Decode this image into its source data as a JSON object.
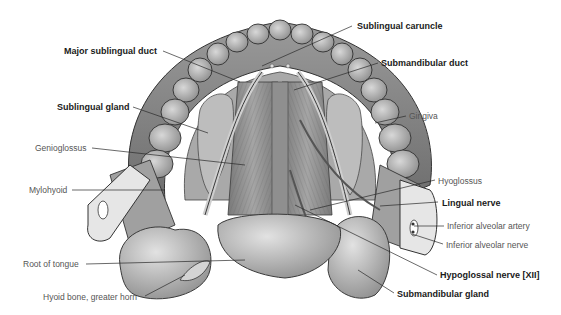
{
  "figure": {
    "labels": [
      {
        "id": "major-sublingual-duct",
        "text": "Major sublingual duct",
        "bold": true,
        "x": 64,
        "y": 46
      },
      {
        "id": "sublingual-caruncle",
        "text": "Sublingual caruncle",
        "bold": true,
        "x": 357,
        "y": 21
      },
      {
        "id": "submandibular-duct",
        "text": "Submandibular duct",
        "bold": true,
        "x": 381,
        "y": 58
      },
      {
        "id": "sublingual-gland",
        "text": "Sublingual gland",
        "bold": true,
        "x": 57,
        "y": 102
      },
      {
        "id": "gingiva",
        "text": "Gingiva",
        "bold": false,
        "x": 409,
        "y": 111
      },
      {
        "id": "genioglossus",
        "text": "Genioglossus",
        "bold": false,
        "x": 35,
        "y": 143
      },
      {
        "id": "mylohyoid",
        "text": "Mylohyoid",
        "bold": false,
        "x": 29,
        "y": 185
      },
      {
        "id": "hyoglossus",
        "text": "Hyoglossus",
        "bold": false,
        "x": 438,
        "y": 176
      },
      {
        "id": "lingual-nerve",
        "text": "Lingual nerve",
        "bold": true,
        "x": 442,
        "y": 198
      },
      {
        "id": "inferior-alveolar-artery",
        "text": "Inferior alveolar artery",
        "bold": false,
        "x": 447,
        "y": 221
      },
      {
        "id": "inferior-alveolar-nerve",
        "text": "Inferior alveolar nerve",
        "bold": false,
        "x": 446,
        "y": 240
      },
      {
        "id": "root-of-tongue",
        "text": "Root of tongue",
        "bold": false,
        "x": 23,
        "y": 259
      },
      {
        "id": "hypoglossal-nerve",
        "text": "Hypoglossal nerve [XII]",
        "bold": true,
        "x": 440,
        "y": 270
      },
      {
        "id": "hyoid-bone-greater-horn",
        "text": "Hyoid bone, greater horn",
        "bold": false,
        "x": 43,
        "y": 292
      },
      {
        "id": "submandibular-gland",
        "text": "Submandibular gland",
        "bold": true,
        "x": 397,
        "y": 289
      }
    ],
    "leaders": [
      {
        "id": "major-sublingual-duct",
        "x1": 163,
        "y1": 51,
        "x2": 240,
        "y2": 82
      },
      {
        "id": "sublingual-caruncle",
        "x1": 352,
        "y1": 26,
        "x2": 262,
        "y2": 66
      },
      {
        "id": "submandibular-duct",
        "x1": 378,
        "y1": 63,
        "x2": 294,
        "y2": 90
      },
      {
        "id": "sublingual-gland",
        "x1": 133,
        "y1": 107,
        "x2": 208,
        "y2": 133
      },
      {
        "id": "gingiva",
        "x1": 406,
        "y1": 116,
        "x2": 375,
        "y2": 123
      },
      {
        "id": "genioglossus",
        "x1": 92,
        "y1": 148,
        "x2": 245,
        "y2": 165
      },
      {
        "id": "mylohyoid",
        "x1": 72,
        "y1": 190,
        "x2": 165,
        "y2": 190
      },
      {
        "id": "hyoglossus",
        "x1": 435,
        "y1": 180,
        "x2": 310,
        "y2": 210
      },
      {
        "id": "lingual-nerve",
        "x1": 438,
        "y1": 202,
        "x2": 380,
        "y2": 206
      },
      {
        "id": "inferior-alveolar-artery",
        "x1": 444,
        "y1": 226,
        "x2": 414,
        "y2": 226
      },
      {
        "id": "inferior-alveolar-nerve",
        "x1": 443,
        "y1": 244,
        "x2": 412,
        "y2": 234
      },
      {
        "id": "root-of-tongue",
        "x1": 86,
        "y1": 264,
        "x2": 245,
        "y2": 260
      },
      {
        "id": "hypoglossal-nerve",
        "x1": 437,
        "y1": 275,
        "x2": 295,
        "y2": 205
      },
      {
        "id": "hyoid-bone-greater-horn",
        "x1": 145,
        "y1": 296,
        "x2": 185,
        "y2": 275
      },
      {
        "id": "submandibular-gland",
        "x1": 394,
        "y1": 293,
        "x2": 358,
        "y2": 270
      }
    ]
  }
}
